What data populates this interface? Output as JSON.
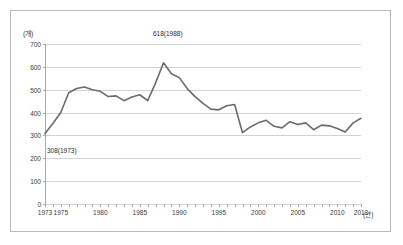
{
  "figure": {
    "unit_label": "(개)",
    "xaxis_unit": "(년)"
  },
  "chart_data": {
    "type": "line",
    "title": "",
    "xlabel": "(년)",
    "ylabel": "(개)",
    "ylim": [
      0,
      700
    ],
    "xlim": [
      1973,
      2013
    ],
    "yticks": [
      0,
      100,
      200,
      300,
      400,
      500,
      600,
      700
    ],
    "xticks": [
      1973,
      1975,
      1980,
      1985,
      1990,
      1995,
      2000,
      2005,
      2010,
      2013
    ],
    "grid": true,
    "legend": false,
    "line_color": "#6b6b6b",
    "annotations": [
      {
        "text": "308(1973)",
        "x": 1973,
        "y": 308
      },
      {
        "text": "618(1988)",
        "x": 1988,
        "y": 618
      }
    ],
    "x": [
      1973,
      1974,
      1975,
      1976,
      1977,
      1978,
      1979,
      1980,
      1981,
      1982,
      1983,
      1984,
      1985,
      1986,
      1987,
      1988,
      1989,
      1990,
      1991,
      1992,
      1993,
      1994,
      1995,
      1996,
      1997,
      1998,
      1999,
      2000,
      2001,
      2002,
      2003,
      2004,
      2005,
      2006,
      2007,
      2008,
      2009,
      2010,
      2011,
      2012,
      2013
    ],
    "values": [
      308,
      352,
      400,
      487,
      505,
      512,
      500,
      493,
      470,
      473,
      452,
      468,
      478,
      452,
      530,
      618,
      570,
      553,
      505,
      470,
      440,
      415,
      412,
      430,
      435,
      312,
      337,
      355,
      366,
      340,
      333,
      360,
      348,
      355,
      325,
      345,
      342,
      330,
      315,
      355,
      375
    ]
  }
}
